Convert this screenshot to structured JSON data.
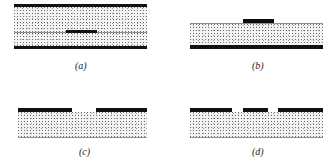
{
  "figure": {
    "background_color": "#ffffff",
    "ink_color": "#111111",
    "stipple_color": "#f4f3f1",
    "hairline_color": "#8e8e8e",
    "panel_count": 4,
    "panels": [
      {
        "id": "panel-a",
        "label": "(a)",
        "description": "Two stippled layers separated by a thin interface, bounded above and below by heavy black bands, with a short black band segment centred on the interface.",
        "x": 14,
        "y": 4,
        "width": 133,
        "height": 45,
        "label_x": 75,
        "label_y": 60,
        "layers": [
          {
            "name": "top-black-band",
            "type": "band",
            "x": 0,
            "y": 0,
            "width": 133,
            "height": 3
          },
          {
            "name": "upper-stipple-layer",
            "type": "stipple",
            "x": 0,
            "y": 3,
            "width": 133,
            "height": 25
          },
          {
            "name": "interface-hairline",
            "type": "hairline",
            "x": 0,
            "y": 28,
            "width": 133,
            "height": 1
          },
          {
            "name": "embedded-band-segment",
            "type": "band",
            "x": 52,
            "y": 26,
            "width": 31,
            "height": 3
          },
          {
            "name": "lower-stipple-layer",
            "type": "stipple",
            "x": 0,
            "y": 29,
            "width": 133,
            "height": 13
          },
          {
            "name": "bottom-black-band",
            "type": "band",
            "x": 0,
            "y": 42,
            "width": 133,
            "height": 3
          }
        ]
      },
      {
        "id": "panel-b",
        "label": "(b)",
        "description": "A single stippled layer on a heavy black base band, with a short raised black band segment sitting on the upper surface, right of centre.",
        "x": 190,
        "y": 19,
        "width": 133,
        "height": 30,
        "label_x": 252,
        "label_y": 60,
        "layers": [
          {
            "name": "raised-band-segment",
            "type": "band-raised",
            "x": 53,
            "y": 0,
            "width": 31,
            "height": 4
          },
          {
            "name": "surface-hairline",
            "type": "hairline",
            "x": 0,
            "y": 4,
            "width": 133,
            "height": 1
          },
          {
            "name": "stipple-layer",
            "type": "stipple",
            "x": 0,
            "y": 5,
            "width": 133,
            "height": 21
          },
          {
            "name": "bottom-black-band",
            "type": "band",
            "x": 0,
            "y": 26,
            "width": 133,
            "height": 4
          }
        ]
      },
      {
        "id": "panel-c",
        "label": "(c)",
        "description": "A stippled layer topped by two heavy black band segments separated by a central gap, with a faint hairline along the bottom edge.",
        "x": 18,
        "y": 108,
        "width": 129,
        "height": 32,
        "label_x": 79,
        "label_y": 146,
        "layers": [
          {
            "name": "top-band-segment-left",
            "type": "band",
            "x": 0,
            "y": 0,
            "width": 54,
            "height": 4
          },
          {
            "name": "top-band-gap",
            "type": "gap",
            "x": 54,
            "y": 0,
            "width": 24,
            "height": 4
          },
          {
            "name": "top-band-segment-right",
            "type": "band",
            "x": 78,
            "y": 0,
            "width": 51,
            "height": 4
          },
          {
            "name": "stipple-layer",
            "type": "stipple",
            "x": 0,
            "y": 4,
            "width": 129,
            "height": 25
          },
          {
            "name": "bottom-hairline",
            "type": "hairline",
            "x": 0,
            "y": 29,
            "width": 129,
            "height": 1
          }
        ]
      },
      {
        "id": "panel-d",
        "label": "(d)",
        "description": "A stippled layer topped by three heavy black band segments separated by two narrow gaps, with a faint hairline along the bottom edge.",
        "x": 190,
        "y": 108,
        "width": 133,
        "height": 32,
        "label_x": 252,
        "label_y": 146,
        "layers": [
          {
            "name": "top-band-segment-left",
            "type": "band",
            "x": 0,
            "y": 0,
            "width": 42,
            "height": 4
          },
          {
            "name": "top-band-gap-left",
            "type": "gap",
            "x": 42,
            "y": 0,
            "width": 11,
            "height": 4
          },
          {
            "name": "top-band-segment-middle",
            "type": "band",
            "x": 53,
            "y": 0,
            "width": 25,
            "height": 4
          },
          {
            "name": "top-band-gap-right",
            "type": "gap",
            "x": 78,
            "y": 0,
            "width": 10,
            "height": 4
          },
          {
            "name": "top-band-segment-right",
            "type": "band",
            "x": 88,
            "y": 0,
            "width": 45,
            "height": 4
          },
          {
            "name": "stipple-layer",
            "type": "stipple",
            "x": 0,
            "y": 4,
            "width": 133,
            "height": 25
          },
          {
            "name": "bottom-hairline",
            "type": "hairline",
            "x": 0,
            "y": 29,
            "width": 133,
            "height": 1
          }
        ]
      }
    ]
  }
}
